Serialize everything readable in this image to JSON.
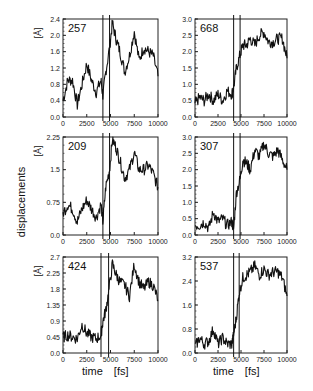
{
  "figure": {
    "ylabel": "displacements",
    "xlabel_left": "time",
    "xlabel_unit": "[fs]",
    "xlabel_right": "time",
    "xlabel_right_unit": "[fs]",
    "unit_label": "[Å]"
  },
  "chart_data": [
    {
      "type": "line",
      "title": "257",
      "panel": "top-left",
      "xlabel": "time [fs]",
      "ylabel": "[Å]",
      "xlim": [
        0,
        10000
      ],
      "ylim": [
        0,
        2.4
      ],
      "xticks": [
        "0",
        "2500",
        "5000",
        "7500",
        "10000"
      ],
      "yticks": [
        "0.0",
        "0.4",
        "0.8",
        "1.2",
        "1.6",
        "2.0",
        "2.4"
      ],
      "vlines": [
        4200,
        4900
      ],
      "x": [
        0,
        500,
        1000,
        1500,
        2000,
        2500,
        3000,
        3500,
        4000,
        4200,
        4500,
        4900,
        5200,
        5600,
        6000,
        6500,
        7000,
        7500,
        8000,
        8500,
        9000,
        9500,
        10000
      ],
      "values": [
        0.4,
        0.9,
        0.9,
        0.3,
        0.8,
        1.3,
        0.9,
        0.6,
        0.9,
        0.5,
        1.1,
        1.7,
        2.3,
        1.9,
        1.6,
        1.1,
        1.5,
        2.1,
        1.4,
        1.7,
        1.6,
        1.5,
        1.0
      ]
    },
    {
      "type": "line",
      "title": "668",
      "panel": "top-right",
      "xlabel": "time [fs]",
      "ylabel": "",
      "xlim": [
        0,
        10000
      ],
      "ylim": [
        0,
        3.0
      ],
      "xticks": [
        "0",
        "2500",
        "5000",
        "7500",
        "10000"
      ],
      "yticks": [
        "0.0",
        "0.5",
        "1.0",
        "1.5",
        "2.0",
        "2.5",
        "3.0"
      ],
      "vlines": [
        4200,
        4900
      ],
      "x": [
        0,
        500,
        1000,
        1500,
        2000,
        2500,
        3000,
        3500,
        4000,
        4200,
        4500,
        4900,
        5200,
        5600,
        6000,
        6500,
        7000,
        7500,
        8000,
        8500,
        9000,
        9500,
        10000
      ],
      "values": [
        0.4,
        0.6,
        0.5,
        0.7,
        0.5,
        0.7,
        0.5,
        0.8,
        0.7,
        0.9,
        1.5,
        1.9,
        2.2,
        2.2,
        2.4,
        2.2,
        2.5,
        2.6,
        2.3,
        2.3,
        2.4,
        2.4,
        1.8
      ]
    },
    {
      "type": "line",
      "title": "209",
      "panel": "middle-left",
      "xlabel": "time [fs]",
      "ylabel": "[Å]",
      "xlim": [
        0,
        10000
      ],
      "ylim": [
        0,
        2.25
      ],
      "xticks": [
        "0",
        "2500",
        "5000",
        "7500",
        "10000"
      ],
      "yticks": [
        "0.0",
        "0.75",
        "1.5",
        "2.25"
      ],
      "vlines": [
        4200,
        4900
      ],
      "x": [
        0,
        500,
        1000,
        1500,
        2000,
        2500,
        3000,
        3500,
        4000,
        4200,
        4500,
        4900,
        5200,
        5600,
        6000,
        6500,
        7000,
        7500,
        8000,
        8500,
        9000,
        9500,
        10000
      ],
      "values": [
        0.5,
        0.7,
        0.6,
        0.3,
        0.6,
        0.8,
        0.6,
        0.4,
        0.7,
        0.3,
        1.1,
        1.5,
        2.2,
        2.0,
        1.7,
        1.3,
        1.5,
        1.9,
        1.5,
        1.5,
        1.6,
        1.4,
        1.1
      ]
    },
    {
      "type": "line",
      "title": "307",
      "panel": "middle-right",
      "xlabel": "time [fs]",
      "ylabel": "",
      "xlim": [
        0,
        10000
      ],
      "ylim": [
        0,
        3.0
      ],
      "xticks": [
        "0",
        "2500",
        "5000",
        "7500",
        "10000"
      ],
      "yticks": [
        "0.0",
        "0.5",
        "1.0",
        "1.5",
        "2.0",
        "2.5",
        "3.0"
      ],
      "vlines": [
        4200,
        4900
      ],
      "x": [
        0,
        500,
        1000,
        1500,
        2000,
        2500,
        3000,
        3500,
        4000,
        4200,
        4500,
        4900,
        5200,
        5600,
        6000,
        6500,
        7000,
        7500,
        8000,
        8500,
        9000,
        9500,
        10000
      ],
      "values": [
        0.3,
        0.3,
        0.4,
        0.2,
        0.7,
        0.4,
        0.5,
        0.3,
        0.4,
        0.2,
        1.3,
        1.7,
        2.3,
        2.2,
        2.0,
        2.6,
        2.4,
        2.8,
        2.5,
        2.4,
        2.6,
        2.3,
        2.0
      ]
    },
    {
      "type": "line",
      "title": "424",
      "panel": "bottom-left",
      "xlabel": "time [fs]",
      "ylabel": "[Å]",
      "xlim": [
        0,
        10000
      ],
      "ylim": [
        0,
        2.7
      ],
      "xticks": [
        "0",
        "2500",
        "5000",
        "7500",
        "10000"
      ],
      "yticks": [
        "0.0",
        "0.45",
        "0.9",
        "1.35",
        "1.8",
        "2.25",
        "2.7"
      ],
      "vlines": [
        4000,
        4800
      ],
      "x": [
        0,
        500,
        1000,
        1500,
        2000,
        2500,
        3000,
        3500,
        4000,
        4200,
        4500,
        4800,
        5200,
        5600,
        6000,
        6500,
        7000,
        7500,
        8000,
        8500,
        9000,
        9500,
        10000
      ],
      "values": [
        0.45,
        0.5,
        0.45,
        0.4,
        0.8,
        0.55,
        0.45,
        0.4,
        0.5,
        0.9,
        1.2,
        1.7,
        2.5,
        2.2,
        2.0,
        1.9,
        1.6,
        2.5,
        2.0,
        1.8,
        2.0,
        1.9,
        1.5
      ]
    },
    {
      "type": "line",
      "title": "537",
      "panel": "bottom-right",
      "xlabel": "time [fs]",
      "ylabel": "",
      "xlim": [
        0,
        10000
      ],
      "ylim": [
        0,
        3.2
      ],
      "xticks": [
        "0",
        "2500",
        "5000",
        "7500",
        "10000"
      ],
      "yticks": [
        "0.0",
        "0.8",
        "1.6",
        "2.4",
        "3.2"
      ],
      "vlines": [
        4200,
        4800
      ],
      "x": [
        0,
        500,
        1000,
        1500,
        2000,
        2500,
        3000,
        3500,
        4000,
        4200,
        4500,
        4800,
        5200,
        5600,
        6000,
        6500,
        7000,
        7500,
        8000,
        8500,
        9000,
        9500,
        10000
      ],
      "values": [
        0.2,
        0.5,
        0.3,
        0.4,
        0.8,
        0.3,
        0.5,
        0.3,
        0.3,
        0.6,
        1.2,
        2.0,
        2.5,
        2.6,
        2.7,
        2.9,
        2.6,
        2.8,
        2.6,
        2.7,
        2.7,
        2.5,
        1.9
      ]
    }
  ]
}
